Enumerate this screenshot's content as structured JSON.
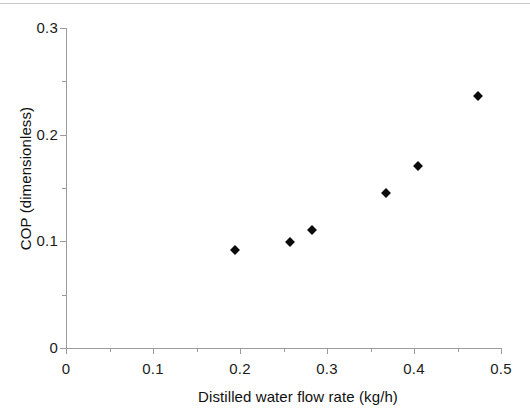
{
  "chart_data": {
    "type": "scatter",
    "title": "",
    "xlabel": "Distilled water flow rate (kg/h)",
    "ylabel": "COP (dimensionless)",
    "xlim": [
      0,
      0.5
    ],
    "ylim": [
      0,
      0.3
    ],
    "grid": false,
    "legend": null,
    "x_major_ticks": [
      0,
      0.1,
      0.2,
      0.3,
      0.4,
      0.5
    ],
    "x_tick_labels": [
      "0",
      "0.1",
      "0.2",
      "0.3",
      "0.4",
      "0.5"
    ],
    "x_minor_ticks": [
      0.05,
      0.15,
      0.25,
      0.35,
      0.45
    ],
    "y_major_ticks": [
      0,
      0.1,
      0.2,
      0.3
    ],
    "y_tick_labels": [
      "0",
      "0.1",
      "0.2",
      "0.3"
    ],
    "y_minor_ticks": [
      0.05,
      0.15,
      0.25
    ],
    "marker": "filled-diamond",
    "marker_color": "#0b0b0b",
    "series": [
      {
        "name": "COP",
        "points": [
          {
            "x": 0.194,
            "y": 0.092
          },
          {
            "x": 0.257,
            "y": 0.099
          },
          {
            "x": 0.283,
            "y": 0.111
          },
          {
            "x": 0.368,
            "y": 0.145
          },
          {
            "x": 0.405,
            "y": 0.171
          },
          {
            "x": 0.474,
            "y": 0.236
          }
        ]
      }
    ]
  },
  "colors": {
    "axis": "#9b9b9b",
    "text": "#141414",
    "marker": "#0b0b0b",
    "background": "#ffffff"
  }
}
